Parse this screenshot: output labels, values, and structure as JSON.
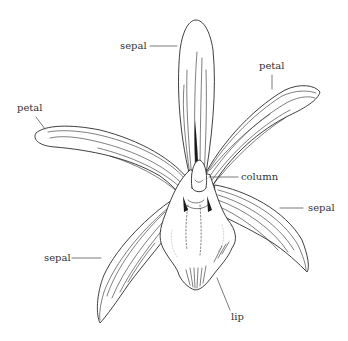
{
  "diagram": {
    "labels": {
      "sepal_top": "sepal",
      "petal_right": "petal",
      "petal_left": "petal",
      "column": "column",
      "sepal_right": "sepal",
      "sepal_left": "sepal",
      "lip": "lip"
    },
    "colors": {
      "background": "#ffffff",
      "line": "#2a2a2a",
      "text": "#333333"
    }
  }
}
